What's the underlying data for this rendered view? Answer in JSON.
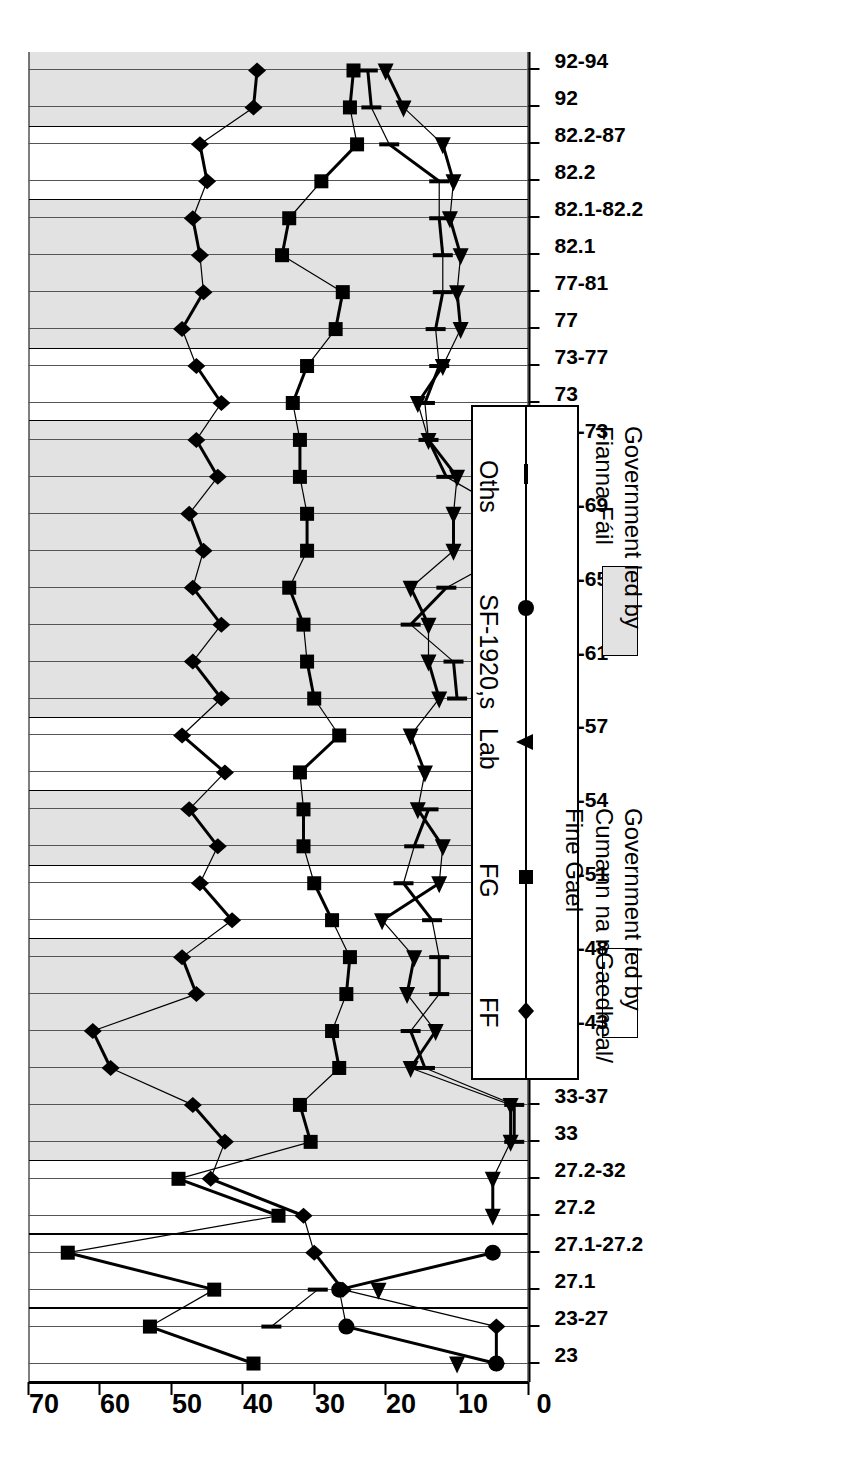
{
  "chart_data": {
    "type": "line",
    "title": "",
    "xlabel": "",
    "ylabel": "",
    "ylim": [
      0,
      70
    ],
    "yticks": [
      0,
      10,
      20,
      30,
      40,
      50,
      60,
      70
    ],
    "grid": false,
    "orientation": "rotated-90",
    "legend_position": "inside-right",
    "categories": [
      "23",
      "23-27",
      "27.1",
      "27.1-27.2",
      "27.2",
      "27.2-32",
      "33",
      "33-37",
      "38",
      "38-43",
      "44",
      "44-48",
      "48",
      "48-51",
      "51",
      "51-54",
      "54",
      "54-57",
      "57",
      "57-61",
      "61",
      "61-65",
      "65",
      "65-69",
      "69",
      "69-73",
      "73",
      "73-77",
      "77",
      "77-81",
      "82.1",
      "82.1-82.2",
      "82.2",
      "82.2-87",
      "92",
      "92-94"
    ],
    "series": [
      {
        "name": "FF",
        "marker": "diamond",
        "values": [
          4.5,
          4.5,
          26,
          30,
          31.5,
          44.5,
          42.5,
          47,
          58.5,
          61,
          46.5,
          48.5,
          41.5,
          46,
          43.5,
          47.5,
          42.5,
          48.5,
          43,
          47,
          43,
          47,
          45.5,
          47.5,
          43.5,
          46.5,
          43,
          46.5,
          48.5,
          45.5,
          46,
          47,
          45,
          46,
          38.5,
          38
        ]
      },
      {
        "name": "FG",
        "marker": "square",
        "values": [
          38.5,
          53,
          44,
          64.5,
          35,
          49,
          30.5,
          32,
          26.5,
          27.5,
          25.5,
          25,
          27.5,
          30,
          31.5,
          31.5,
          32,
          26.5,
          30,
          31,
          31.5,
          33.5,
          31,
          31,
          32,
          32,
          33,
          31,
          27,
          26,
          34.5,
          33.5,
          29,
          24,
          25,
          24.5
        ]
      },
      {
        "name": "Lab",
        "marker": "triangle",
        "values": [
          10,
          null,
          21,
          null,
          5,
          5,
          2.5,
          2.5,
          16.5,
          13,
          17,
          16,
          20.5,
          12.5,
          12,
          15.5,
          14.5,
          16.5,
          12.5,
          14,
          14,
          16.5,
          10.5,
          10.5,
          10,
          14,
          15.5,
          12,
          9.5,
          10,
          9.5,
          11,
          10.5,
          12,
          17.5,
          20
        ]
      },
      {
        "name": "SF-1920,s",
        "marker": "circle",
        "values": [
          4.5,
          25.5,
          26.5,
          5,
          null,
          null,
          null,
          null,
          null,
          null,
          null,
          null,
          null,
          null,
          null,
          null,
          null,
          null,
          null,
          null,
          null,
          null,
          null,
          null,
          null,
          null,
          null,
          null,
          null,
          null,
          null,
          null,
          null,
          null,
          null,
          null
        ]
      },
      {
        "name": "Oths",
        "marker": "tick",
        "values": [
          null,
          36,
          29.5,
          null,
          null,
          null,
          2,
          2,
          14.5,
          16.5,
          12.5,
          12.5,
          13.5,
          17.5,
          16,
          14,
          null,
          null,
          10,
          10.5,
          16.5,
          11.5,
          2,
          2.5,
          11.5,
          14,
          14.5,
          12.5,
          13,
          12,
          12,
          12.5,
          12.5,
          19.5,
          22,
          22.5
        ]
      }
    ],
    "bands": [
      {
        "label": "23",
        "type": "fg"
      },
      {
        "label": "23-27",
        "type": "fg"
      },
      {
        "label": "27.1",
        "type": "fg"
      },
      {
        "label": "27.1-27.2",
        "type": "fg"
      },
      {
        "label": "27.2",
        "type": "fg"
      },
      {
        "label": "27.2-32",
        "type": "fg"
      },
      {
        "label": "33",
        "type": "ff"
      },
      {
        "label": "33-37",
        "type": "ff"
      },
      {
        "label": "38",
        "type": "ff"
      },
      {
        "label": "38-43",
        "type": "ff"
      },
      {
        "label": "44",
        "type": "ff"
      },
      {
        "label": "44-48",
        "type": "ff"
      },
      {
        "label": "48",
        "type": "fg"
      },
      {
        "label": "48-51",
        "type": "fg"
      },
      {
        "label": "51",
        "type": "ff"
      },
      {
        "label": "51-54",
        "type": "ff"
      },
      {
        "label": "54",
        "type": "fg"
      },
      {
        "label": "54-57",
        "type": "fg"
      },
      {
        "label": "57",
        "type": "ff"
      },
      {
        "label": "57-61",
        "type": "ff"
      },
      {
        "label": "61",
        "type": "ff"
      },
      {
        "label": "61-65",
        "type": "ff"
      },
      {
        "label": "65",
        "type": "ff"
      },
      {
        "label": "65-69",
        "type": "ff"
      },
      {
        "label": "69",
        "type": "ff"
      },
      {
        "label": "69-73",
        "type": "ff"
      },
      {
        "label": "73",
        "type": "fg"
      },
      {
        "label": "73-77",
        "type": "fg"
      },
      {
        "label": "77",
        "type": "ff"
      },
      {
        "label": "77-81",
        "type": "ff"
      },
      {
        "label": "82.1",
        "type": "ff"
      },
      {
        "label": "82.1-82.2",
        "type": "ff"
      },
      {
        "label": "82.2",
        "type": "fg"
      },
      {
        "label": "82.2-87",
        "type": "fg"
      },
      {
        "label": "92",
        "type": "ff"
      },
      {
        "label": "92-94",
        "type": "ff"
      }
    ]
  },
  "legend": {
    "items": [
      {
        "label": "FF",
        "marker": "diamond"
      },
      {
        "label": "FG",
        "marker": "square"
      },
      {
        "label": "Lab",
        "marker": "triangle"
      },
      {
        "label": "SF-1920,s",
        "marker": "circle"
      },
      {
        "label": "Oths",
        "marker": "tick"
      }
    ]
  },
  "government_key": {
    "fg_label": "Government led by\nCumann na nGaedheal/\nFine Gael",
    "ff_label": "Government led by\nFianna Fáil",
    "fg_color": "#ffffff",
    "ff_color": "#e2e2e2"
  }
}
